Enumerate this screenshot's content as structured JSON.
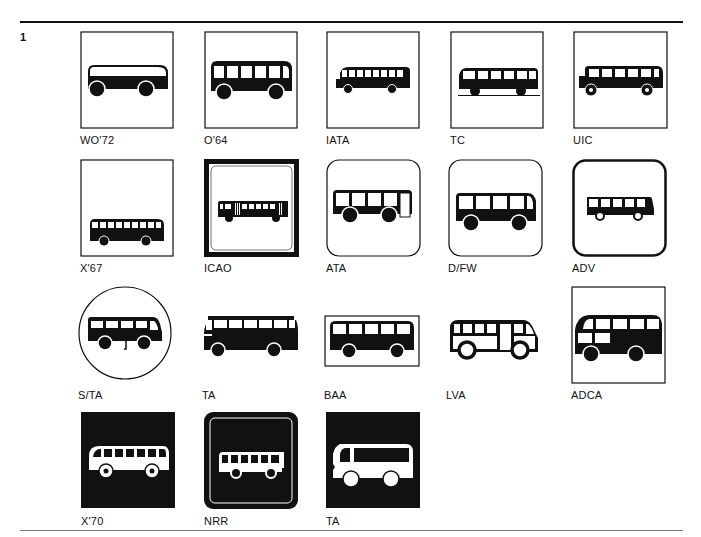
{
  "figure": {
    "number": "1"
  },
  "symbols": [
    {
      "label": "WO'72",
      "frame": "square"
    },
    {
      "label": "O'64",
      "frame": "square"
    },
    {
      "label": "IATA",
      "frame": "square"
    },
    {
      "label": "TC",
      "frame": "square"
    },
    {
      "label": "UIC",
      "frame": "square"
    },
    {
      "label": "X'67",
      "frame": "square"
    },
    {
      "label": "ICAO",
      "frame": "thick-square"
    },
    {
      "label": "ATA",
      "frame": "rounded"
    },
    {
      "label": "D/FW",
      "frame": "rounded"
    },
    {
      "label": "ADV",
      "frame": "thick-rounded"
    },
    {
      "label": "S/TA",
      "frame": "circle"
    },
    {
      "label": "TA",
      "frame": "none"
    },
    {
      "label": "BAA",
      "frame": "rectangle"
    },
    {
      "label": "LVA",
      "frame": "none"
    },
    {
      "label": "ADCA",
      "frame": "square"
    },
    {
      "label": "X'70",
      "frame": "black-square"
    },
    {
      "label": "NRR",
      "frame": "black-rounded"
    },
    {
      "label": "TA",
      "frame": "black-square"
    }
  ],
  "colors": {
    "ink": "#111111",
    "paper": "#ffffff"
  }
}
